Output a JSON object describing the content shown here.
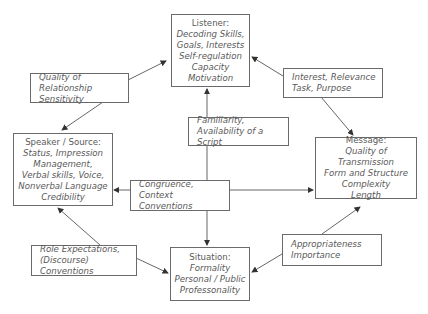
{
  "nodes": {
    "listener": {
      "title": "Listener:",
      "lines": [
        "Decoding Skills,",
        "Goals, Interests",
        "Self-regulation",
        "Capacity",
        "Motivation"
      ]
    },
    "speaker": {
      "title": "Speaker / Source:",
      "lines": [
        "Status, Impression",
        "Management,",
        "Verbal skills, Voice,",
        "Nonverbal Language",
        "Credibility"
      ]
    },
    "message": {
      "title": "Message:",
      "lines": [
        "Quality of Transmission",
        "Form and Structure",
        "Complexity",
        "Length"
      ]
    },
    "situation": {
      "title": "Situation:",
      "lines": [
        "Formality",
        "Personal / Public",
        "Professonality"
      ]
    }
  },
  "factors": {
    "relationship": [
      "Quality of Relationship",
      "Sensitivity"
    ],
    "interest": [
      "Interest, Relevance",
      "Task, Purpose"
    ],
    "familiarity": [
      "Familiarity,",
      "Availability of a Script"
    ],
    "congruence": [
      "Congruence, Context",
      "Conventions"
    ],
    "role": [
      "Role Expectations,",
      "(Discourse) Conventions"
    ],
    "appropriateness": [
      "Appropriateness",
      "Importance"
    ]
  },
  "colors": {
    "line": "#555555",
    "border": "#6a6a6a",
    "text": "#5a5a5a"
  }
}
